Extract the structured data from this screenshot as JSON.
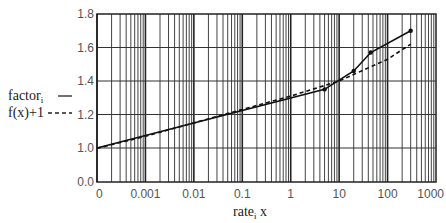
{
  "chart_data": {
    "type": "line",
    "title": "",
    "xlabel": "rate_i x",
    "xlabel_main": "rate",
    "xlabel_sub": "i",
    "xlabel_suffix": " x",
    "ylabel": "",
    "xscale": "log",
    "xlim": [
      0.0001,
      1000
    ],
    "ylim": [
      0.0,
      1.8
    ],
    "grid": true,
    "x_tick_labels": [
      "0",
      "0.001",
      "0.01",
      "0.1",
      "1",
      "10",
      "100",
      "1000"
    ],
    "y_tick_labels": [
      "0.0",
      "1.0",
      "1.2",
      "1.4",
      "1.6",
      "1.8"
    ],
    "legend_position": "left",
    "series": [
      {
        "name": "factor_i",
        "legend_main": "factor",
        "legend_sub": "i",
        "style": "solid",
        "markers": true,
        "x": [
          0.0001,
          5,
          20,
          45,
          300
        ],
        "y": [
          1.0,
          1.35,
          1.46,
          1.57,
          1.7
        ]
      },
      {
        "name": "f(x)+1",
        "legend_main": "f(x)+1",
        "style": "dashed",
        "markers": false,
        "x": [
          0.0001,
          0.001,
          0.01,
          0.1,
          1,
          10,
          100,
          300
        ],
        "y": [
          0.99,
          1.07,
          1.15,
          1.23,
          1.31,
          1.4,
          1.53,
          1.62
        ]
      }
    ]
  }
}
